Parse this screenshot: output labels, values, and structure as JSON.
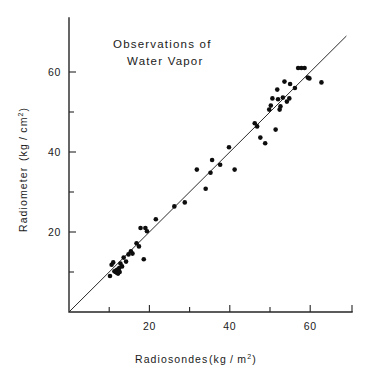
{
  "figure": {
    "title_line1": "Observations of",
    "title_line2": "Water Vapor",
    "background": "#ffffff",
    "ink_color": "#0d0d0d"
  },
  "axes": {
    "x_title_main": "Radiosondes",
    "x_title_units_pre": "(kg / m",
    "x_title_units_sup": "2",
    "x_title_units_post": ")",
    "y_title_main": "Radiometer",
    "y_title_units_pre": "(kg / cm",
    "y_title_units_sup": "2",
    "y_title_units_post": ")",
    "x_tick_labels": [
      "20",
      "40",
      "60"
    ],
    "y_tick_labels": [
      "20",
      "40",
      "60"
    ]
  },
  "chart_data": {
    "type": "scatter",
    "title": "Observations of Water Vapor",
    "xlabel": "Radiosondes (kg/m^2)",
    "ylabel": "Radiometer (kg/cm^2)",
    "xlim": [
      0,
      68
    ],
    "ylim": [
      0,
      71
    ],
    "grid": false,
    "legend": null,
    "x_major_ticks": [
      20,
      40,
      60
    ],
    "y_major_ticks": [
      20,
      40,
      60
    ],
    "x_minor_ticks": [
      10,
      30,
      50
    ],
    "y_minor_ticks": [
      10,
      30,
      50
    ],
    "reference_line": {
      "type": "identity",
      "label": "1:1 line",
      "slope": 1,
      "intercept": 0,
      "x_start": 0,
      "x_end": 69
    },
    "series": [
      {
        "name": "Water vapor observations",
        "marker": "filled-circle",
        "color": "#0d0d0d",
        "points": [
          [
            10.2,
            9.0
          ],
          [
            10.6,
            11.8
          ],
          [
            11.0,
            12.4
          ],
          [
            11.3,
            10.2
          ],
          [
            11.6,
            10.0
          ],
          [
            11.8,
            10.4
          ],
          [
            11.9,
            9.8
          ],
          [
            12.0,
            10.1
          ],
          [
            12.1,
            10.6
          ],
          [
            12.2,
            9.6
          ],
          [
            12.3,
            10.3
          ],
          [
            12.5,
            11.0
          ],
          [
            12.6,
            10.0
          ],
          [
            12.8,
            12.1
          ],
          [
            13.2,
            11.4
          ],
          [
            13.6,
            13.6
          ],
          [
            14.2,
            12.6
          ],
          [
            14.8,
            14.4
          ],
          [
            15.4,
            15.2
          ],
          [
            15.8,
            14.6
          ],
          [
            16.8,
            17.2
          ],
          [
            17.4,
            16.4
          ],
          [
            17.8,
            21.0
          ],
          [
            18.6,
            13.2
          ],
          [
            19.0,
            21.0
          ],
          [
            19.4,
            20.2
          ],
          [
            21.6,
            23.2
          ],
          [
            26.2,
            26.4
          ],
          [
            28.8,
            27.4
          ],
          [
            31.8,
            35.6
          ],
          [
            34.0,
            30.8
          ],
          [
            35.2,
            34.8
          ],
          [
            35.6,
            38.0
          ],
          [
            37.6,
            36.8
          ],
          [
            39.8,
            41.2
          ],
          [
            41.2,
            35.6
          ],
          [
            46.2,
            47.2
          ],
          [
            46.8,
            46.4
          ],
          [
            47.6,
            43.6
          ],
          [
            48.8,
            42.2
          ],
          [
            49.8,
            50.6
          ],
          [
            50.2,
            51.6
          ],
          [
            50.6,
            53.4
          ],
          [
            51.4,
            45.6
          ],
          [
            51.8,
            55.6
          ],
          [
            52.0,
            53.2
          ],
          [
            52.4,
            50.6
          ],
          [
            52.6,
            51.4
          ],
          [
            53.2,
            53.6
          ],
          [
            53.6,
            57.6
          ],
          [
            54.2,
            52.6
          ],
          [
            54.8,
            53.4
          ],
          [
            55.0,
            57.0
          ],
          [
            56.2,
            56.0
          ],
          [
            57.0,
            61.0
          ],
          [
            57.8,
            61.0
          ],
          [
            58.6,
            61.0
          ],
          [
            59.4,
            58.6
          ],
          [
            59.8,
            58.4
          ],
          [
            62.8,
            57.4
          ]
        ]
      }
    ]
  }
}
